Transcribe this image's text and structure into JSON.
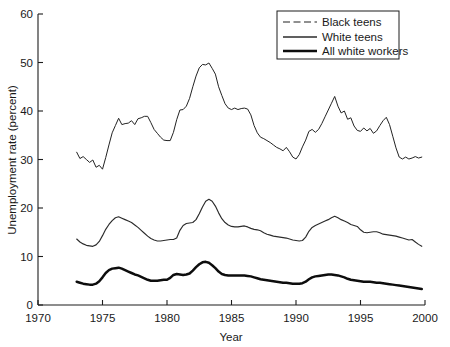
{
  "chart_data": {
    "type": "line",
    "title": "",
    "xlabel": "Year",
    "ylabel": "Unemployment rate (percent)",
    "xlim": [
      1970,
      2000
    ],
    "ylim": [
      0,
      60
    ],
    "xticks": [
      "1970",
      "1975",
      "1980",
      "1985",
      "1990",
      "1995",
      "2000"
    ],
    "yticks": [
      "0",
      "10",
      "20",
      "30",
      "40",
      "50",
      "60"
    ],
    "grid": false,
    "legend_position": "top-right",
    "legend": [
      "Black teens",
      "White teens",
      "All white workers"
    ],
    "x": [
      1973.0,
      1973.25,
      1973.5,
      1973.75,
      1974.0,
      1974.25,
      1974.5,
      1974.75,
      1975.0,
      1975.25,
      1975.5,
      1975.75,
      1976.0,
      1976.25,
      1976.5,
      1976.75,
      1977.0,
      1977.25,
      1977.5,
      1977.75,
      1978.0,
      1978.25,
      1978.5,
      1978.75,
      1979.0,
      1979.25,
      1979.5,
      1979.75,
      1980.0,
      1980.25,
      1980.5,
      1980.75,
      1981.0,
      1981.25,
      1981.5,
      1981.75,
      1982.0,
      1982.25,
      1982.5,
      1982.75,
      1983.0,
      1983.25,
      1983.5,
      1983.75,
      1984.0,
      1984.25,
      1984.5,
      1984.75,
      1985.0,
      1985.25,
      1985.5,
      1985.75,
      1986.0,
      1986.25,
      1986.5,
      1986.75,
      1987.0,
      1987.25,
      1987.5,
      1987.75,
      1988.0,
      1988.25,
      1988.5,
      1988.75,
      1989.0,
      1989.25,
      1989.5,
      1989.75,
      1990.0,
      1990.25,
      1990.5,
      1990.75,
      1991.0,
      1991.25,
      1991.5,
      1991.75,
      1992.0,
      1992.25,
      1992.5,
      1992.75,
      1993.0,
      1993.25,
      1993.5,
      1993.75,
      1994.0,
      1994.25,
      1994.5,
      1994.75,
      1995.0,
      1995.25,
      1995.5,
      1995.75,
      1996.0,
      1996.25,
      1996.5,
      1996.75,
      1997.0,
      1997.25,
      1997.5,
      1997.75,
      1998.0,
      1998.25,
      1998.5,
      1998.75,
      1999.0,
      1999.25,
      1999.5,
      1999.75
    ],
    "series": [
      {
        "name": "Black teens",
        "style": "dashed",
        "values": [
          31.5,
          30.2,
          30.6,
          30.0,
          29.4,
          29.9,
          28.4,
          28.8,
          28.0,
          30.4,
          33.0,
          35.5,
          37.0,
          38.5,
          37.2,
          37.4,
          37.5,
          38.0,
          37.2,
          38.4,
          38.6,
          38.9,
          38.9,
          37.6,
          36.2,
          35.4,
          34.6,
          34.0,
          33.9,
          33.9,
          35.6,
          38.2,
          40.2,
          40.3,
          41.0,
          42.6,
          45.0,
          47.2,
          48.9,
          49.6,
          49.5,
          49.9,
          48.8,
          47.6,
          45.0,
          43.2,
          41.5,
          40.6,
          40.3,
          40.6,
          40.3,
          40.5,
          40.6,
          40.4,
          39.2,
          37.0,
          35.5,
          34.6,
          34.3,
          33.9,
          33.5,
          33.0,
          32.5,
          32.2,
          31.8,
          32.5,
          31.6,
          30.5,
          30.1,
          31.0,
          32.6,
          34.0,
          35.8,
          36.2,
          35.6,
          36.2,
          37.4,
          38.8,
          40.2,
          41.6,
          43.0,
          41.0,
          39.6,
          40.0,
          38.3,
          38.6,
          36.9,
          36.0,
          35.8,
          36.5,
          35.9,
          36.4,
          35.4,
          35.9,
          37.0,
          38.0,
          38.7,
          37.2,
          34.8,
          32.4,
          30.5,
          30.1,
          30.5,
          30.1,
          30.3,
          30.6,
          30.3,
          30.5
        ]
      },
      {
        "name": "White teens",
        "style": "thin-solid",
        "values": [
          13.6,
          13.0,
          12.6,
          12.3,
          12.2,
          12.1,
          12.4,
          13.1,
          14.3,
          15.6,
          16.6,
          17.4,
          18.0,
          18.2,
          17.9,
          17.6,
          17.3,
          17.0,
          16.5,
          16.0,
          15.4,
          14.8,
          14.2,
          13.7,
          13.4,
          13.2,
          13.2,
          13.3,
          13.4,
          13.5,
          13.5,
          13.8,
          15.4,
          16.4,
          16.8,
          16.9,
          17.0,
          17.6,
          18.8,
          20.2,
          21.4,
          21.8,
          21.4,
          20.4,
          19.0,
          17.8,
          17.0,
          16.5,
          16.2,
          16.1,
          16.1,
          16.2,
          16.3,
          16.1,
          15.8,
          15.6,
          15.5,
          15.3,
          14.9,
          14.6,
          14.4,
          14.2,
          14.1,
          14.0,
          13.9,
          13.8,
          13.6,
          13.4,
          13.3,
          13.2,
          13.3,
          14.0,
          15.2,
          16.0,
          16.4,
          16.7,
          17.0,
          17.3,
          17.6,
          18.0,
          18.3,
          18.0,
          17.6,
          17.3,
          17.0,
          16.6,
          16.4,
          16.2,
          15.5,
          15.0,
          14.9,
          15.0,
          15.1,
          15.1,
          14.9,
          14.6,
          14.5,
          14.4,
          14.3,
          14.2,
          14.0,
          13.8,
          13.6,
          13.4,
          13.5,
          13.0,
          12.5,
          12.1
        ]
      },
      {
        "name": "All white workers",
        "style": "thick-solid",
        "values": [
          4.8,
          4.6,
          4.4,
          4.3,
          4.2,
          4.2,
          4.4,
          4.9,
          5.7,
          6.6,
          7.2,
          7.5,
          7.6,
          7.7,
          7.5,
          7.2,
          6.9,
          6.6,
          6.3,
          6.1,
          5.8,
          5.5,
          5.2,
          5.0,
          5.0,
          5.0,
          5.1,
          5.2,
          5.2,
          5.6,
          6.2,
          6.4,
          6.3,
          6.2,
          6.3,
          6.5,
          7.1,
          7.8,
          8.4,
          8.8,
          8.9,
          8.7,
          8.2,
          7.6,
          6.9,
          6.4,
          6.2,
          6.1,
          6.1,
          6.1,
          6.1,
          6.1,
          6.1,
          6.0,
          5.9,
          5.7,
          5.5,
          5.3,
          5.2,
          5.1,
          5.0,
          4.9,
          4.8,
          4.7,
          4.6,
          4.6,
          4.5,
          4.4,
          4.4,
          4.4,
          4.5,
          4.8,
          5.3,
          5.7,
          5.9,
          6.0,
          6.1,
          6.2,
          6.3,
          6.3,
          6.2,
          6.1,
          5.9,
          5.7,
          5.4,
          5.2,
          5.1,
          5.0,
          4.9,
          4.8,
          4.8,
          4.8,
          4.7,
          4.6,
          4.6,
          4.5,
          4.4,
          4.3,
          4.2,
          4.1,
          4.0,
          3.9,
          3.8,
          3.7,
          3.6,
          3.5,
          3.4,
          3.3
        ]
      }
    ]
  }
}
